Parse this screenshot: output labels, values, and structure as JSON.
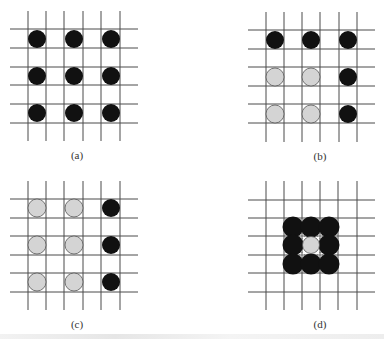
{
  "figure": {
    "colors": {
      "grid": "#4a4a4a",
      "filled": "#111111",
      "empty": "#d4d4d4",
      "empty_stroke": "#555555",
      "background": "#ffffff"
    },
    "panels": [
      {
        "id": "a",
        "label": "(a)",
        "description": "3x3 lattice of sites, all occupied (black)",
        "grid": {
          "vx": [
            28,
            46,
            64,
            83,
            101,
            120
          ],
          "hy": [
            29,
            48,
            67,
            85,
            104,
            123
          ],
          "x_range": [
            10,
            138
          ],
          "y_range": [
            11,
            141
          ]
        },
        "label_pos": [
          77,
          159
        ],
        "sites": [
          {
            "cx": 37,
            "cy": 39,
            "state": "filled"
          },
          {
            "cx": 74,
            "cy": 39,
            "state": "filled"
          },
          {
            "cx": 111,
            "cy": 39,
            "state": "filled"
          },
          {
            "cx": 37,
            "cy": 76,
            "state": "filled"
          },
          {
            "cx": 74,
            "cy": 76,
            "state": "filled"
          },
          {
            "cx": 111,
            "cy": 76,
            "state": "filled"
          },
          {
            "cx": 37,
            "cy": 113,
            "state": "filled"
          },
          {
            "cx": 74,
            "cy": 113,
            "state": "filled"
          },
          {
            "cx": 111,
            "cy": 113,
            "state": "filled"
          }
        ]
      },
      {
        "id": "b",
        "label": "(b)",
        "description": "Top row and right column occupied (black); remaining four sites empty (gray)",
        "grid": {
          "vx": [
            266,
            284,
            302,
            320,
            339,
            357
          ],
          "hy": [
            30,
            49,
            67,
            86,
            104,
            123
          ],
          "x_range": [
            248,
            375
          ],
          "y_range": [
            12,
            142
          ]
        },
        "label_pos": [
          320,
          160
        ],
        "sites": [
          {
            "cx": 275,
            "cy": 40,
            "state": "filled"
          },
          {
            "cx": 311,
            "cy": 40,
            "state": "filled"
          },
          {
            "cx": 348,
            "cy": 40,
            "state": "filled"
          },
          {
            "cx": 275,
            "cy": 77,
            "state": "empty"
          },
          {
            "cx": 311,
            "cy": 77,
            "state": "empty"
          },
          {
            "cx": 348,
            "cy": 77,
            "state": "filled"
          },
          {
            "cx": 275,
            "cy": 114,
            "state": "empty"
          },
          {
            "cx": 311,
            "cy": 114,
            "state": "empty"
          },
          {
            "cx": 348,
            "cy": 114,
            "state": "filled"
          }
        ]
      },
      {
        "id": "c",
        "label": "(c)",
        "description": "Only right column occupied (black); left two columns empty (gray)",
        "grid": {
          "vx": [
            28,
            46,
            64,
            83,
            101,
            120
          ],
          "hy": [
            199,
            218,
            236,
            255,
            273,
            292
          ],
          "x_range": [
            10,
            138
          ],
          "y_range": [
            181,
            310
          ]
        },
        "label_pos": [
          77,
          328
        ],
        "sites": [
          {
            "cx": 37,
            "cy": 208,
            "state": "empty"
          },
          {
            "cx": 74,
            "cy": 208,
            "state": "empty"
          },
          {
            "cx": 111,
            "cy": 208,
            "state": "filled"
          },
          {
            "cx": 37,
            "cy": 245,
            "state": "empty"
          },
          {
            "cx": 74,
            "cy": 245,
            "state": "empty"
          },
          {
            "cx": 111,
            "cy": 245,
            "state": "filled"
          },
          {
            "cx": 37,
            "cy": 282,
            "state": "empty"
          },
          {
            "cx": 74,
            "cy": 282,
            "state": "empty"
          },
          {
            "cx": 111,
            "cy": 282,
            "state": "filled"
          }
        ]
      },
      {
        "id": "d",
        "label": "(d)",
        "description": "Dense 3x3 cluster of overlapping occupied sites (black) surrounding one empty central site (gray)",
        "grid": {
          "vx": [
            266,
            284,
            302,
            320,
            338,
            357
          ],
          "hy": [
            200,
            218,
            236,
            255,
            273,
            292
          ],
          "x_range": [
            248,
            375
          ],
          "y_range": [
            181,
            310
          ]
        },
        "label_pos": [
          320,
          328
        ],
        "sites": [
          {
            "cx": 293,
            "cy": 227,
            "state": "filled"
          },
          {
            "cx": 311,
            "cy": 227,
            "state": "filled"
          },
          {
            "cx": 329,
            "cy": 227,
            "state": "filled"
          },
          {
            "cx": 293,
            "cy": 245,
            "state": "filled"
          },
          {
            "cx": 311,
            "cy": 245,
            "state": "empty"
          },
          {
            "cx": 329,
            "cy": 245,
            "state": "filled"
          },
          {
            "cx": 293,
            "cy": 264,
            "state": "filled"
          },
          {
            "cx": 311,
            "cy": 264,
            "state": "filled"
          },
          {
            "cx": 329,
            "cy": 264,
            "state": "filled"
          }
        ]
      }
    ],
    "site_radius": 9,
    "dense_site_radius": 10.5
  }
}
